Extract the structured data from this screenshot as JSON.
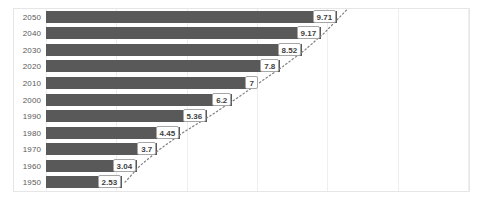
{
  "chart_data": {
    "type": "bar",
    "orientation": "horizontal",
    "title": "",
    "subtitle": "",
    "xlabel": "",
    "ylabel": "",
    "categories": [
      "1950",
      "1960",
      "1970",
      "1980",
      "1990",
      "2000",
      "2010",
      "2020",
      "2030",
      "2040",
      "2050"
    ],
    "values": [
      2.53,
      3.04,
      3.7,
      4.45,
      5.36,
      6.2,
      7,
      7.8,
      8.52,
      9.17,
      9.71
    ],
    "value_labels": [
      "2.53",
      "3.04",
      "3.7",
      "4.45",
      "5.36",
      "6.2",
      "7",
      "7.8",
      "8.52",
      "9.17",
      "9.71"
    ],
    "xlim": [
      0,
      13
    ],
    "ylim": null,
    "grid": "vertical",
    "grid_count": 6,
    "legend": "none",
    "bar_color": "#595959",
    "label_box_fill": "#ffffff",
    "label_box_border": "#a6a6a6",
    "label_text_color": "#3f3f3f",
    "axis_label_color": "#595959",
    "gridline_color": "#eeeeee",
    "plot_border_color": "#e6e6e6",
    "background_color": "#ffffff",
    "trendline": {
      "present": true,
      "style": "dotted",
      "color": "#808080",
      "note": "dotted connector passing through data label markers, extrapolated beyond 2050"
    },
    "category_order_top_to_bottom": [
      "2050",
      "2040",
      "2030",
      "2020",
      "2010",
      "2000",
      "1990",
      "1980",
      "1970",
      "1960",
      "1950"
    ]
  }
}
